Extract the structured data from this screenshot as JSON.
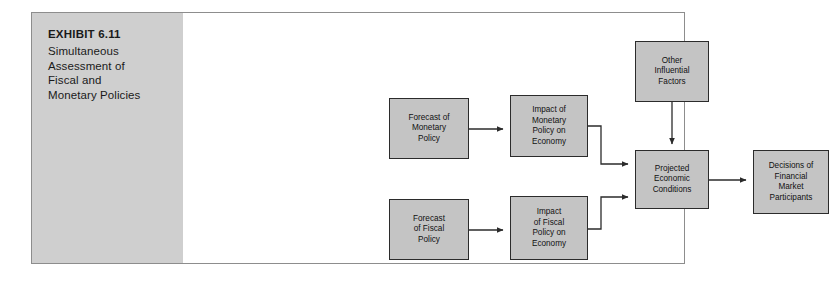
{
  "exhibit": {
    "number": "EXHIBIT 6.11",
    "title": "Simultaneous\nAssessment of\nFiscal and\nMonetary Policies"
  },
  "colors": {
    "panel_gray": "#cfcfcf",
    "box_fill": "#c4c4c4",
    "box_border": "#2b2b2b",
    "frame_border": "#8d8d8d",
    "text": "#111111",
    "connector": "#2b2b2b",
    "page_background": "#ffffff"
  },
  "diagram": {
    "type": "flowchart",
    "nodes": [
      {
        "id": "forecast-monetary",
        "label": "Forecast of\nMonetary\nPolicy"
      },
      {
        "id": "impact-monetary",
        "label": "Impact of\nMonetary\nPolicy on\nEconomy"
      },
      {
        "id": "other-factors",
        "label": "Other\nInfluential\nFactors"
      },
      {
        "id": "forecast-fiscal",
        "label": "Forecast\nof Fiscal\nPolicy"
      },
      {
        "id": "impact-fiscal",
        "label": "Impact\nof Fiscal\nPolicy on\nEconomy"
      },
      {
        "id": "projected",
        "label": "Projected\nEconomic\nConditions"
      },
      {
        "id": "decisions",
        "label": "Decisions of\nFinancial\nMarket\nParticipants"
      }
    ],
    "edges": [
      {
        "from": "forecast-monetary",
        "to": "impact-monetary",
        "style": "straight-right"
      },
      {
        "from": "impact-monetary",
        "to": "projected",
        "style": "elbow-down-right"
      },
      {
        "from": "other-factors",
        "to": "projected",
        "style": "straight-down"
      },
      {
        "from": "forecast-fiscal",
        "to": "impact-fiscal",
        "style": "straight-right"
      },
      {
        "from": "impact-fiscal",
        "to": "projected",
        "style": "elbow-up-right"
      },
      {
        "from": "projected",
        "to": "decisions",
        "style": "straight-right"
      }
    ]
  }
}
